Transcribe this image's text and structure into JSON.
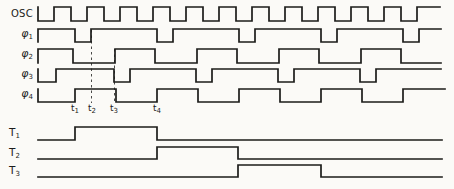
{
  "figure": {
    "type": "timing-diagram",
    "width": 454,
    "height": 189,
    "bg_color": "#fbfaf7",
    "line_color": "#1c1c1a",
    "guide_color": "#4a4a48"
  },
  "waveforms": [
    {
      "id": "osc",
      "label": {
        "base": "OSC",
        "sub": ""
      },
      "row_top": 7,
      "row_bottom": 21,
      "x_start": 38,
      "x_end": 440,
      "start_level": 0,
      "initial_edge": true,
      "transitions": [
        54,
        71,
        87,
        104,
        120,
        137,
        153,
        170,
        186,
        203,
        219,
        236,
        252,
        269,
        285,
        302,
        318,
        335,
        351,
        368,
        384,
        401,
        417
      ]
    },
    {
      "id": "phi1",
      "label": {
        "base": "φ",
        "sub": "1"
      },
      "row_top": 29,
      "row_bottom": 42,
      "x_start": 38,
      "x_end": 441,
      "start_level": 1,
      "initial_edge": true,
      "transitions": [
        75,
        91,
        157,
        173,
        239,
        255,
        321,
        337,
        403,
        419
      ]
    },
    {
      "id": "phi2",
      "label": {
        "base": "φ",
        "sub": "2"
      },
      "row_top": 49,
      "row_bottom": 63,
      "x_start": 38,
      "x_end": 441,
      "start_level": 1,
      "initial_edge": true,
      "transitions": [
        73,
        115,
        155,
        197,
        237,
        279,
        319,
        361,
        401
      ]
    },
    {
      "id": "phi3",
      "label": {
        "base": "φ",
        "sub": "3"
      },
      "row_top": 69,
      "row_bottom": 82,
      "x_start": 38,
      "x_end": 441,
      "start_level": 0,
      "initial_edge": true,
      "transitions": [
        56,
        114,
        130,
        196,
        212,
        278,
        294,
        360,
        376
      ]
    },
    {
      "id": "phi4",
      "label": {
        "base": "φ",
        "sub": "4"
      },
      "row_top": 89,
      "row_bottom": 102,
      "x_start": 38,
      "x_end": 445,
      "start_level": 0,
      "initial_edge": true,
      "transitions": [
        75,
        116,
        157,
        198,
        239,
        280,
        321,
        362,
        403
      ]
    },
    {
      "id": "T1",
      "label": {
        "base": "T",
        "sub": "1"
      },
      "row_top": 127,
      "row_bottom": 140,
      "x_start": 38,
      "x_end": 442,
      "start_level": 0,
      "initial_edge": false,
      "transitions": [
        75,
        157
      ]
    },
    {
      "id": "T2",
      "label": {
        "base": "T",
        "sub": "2"
      },
      "row_top": 147,
      "row_bottom": 159,
      "x_start": 38,
      "x_end": 442,
      "start_level": 0,
      "initial_edge": false,
      "transitions": [
        157,
        238
      ]
    },
    {
      "id": "T3",
      "label": {
        "base": "T",
        "sub": "3"
      },
      "row_top": 165,
      "row_bottom": 177,
      "x_start": 38,
      "x_end": 442,
      "start_level": 0,
      "initial_edge": false,
      "transitions": [
        238,
        321
      ]
    }
  ],
  "t_markers": [
    {
      "base": "t",
      "sub": "1",
      "x": 75
    },
    {
      "base": "t",
      "sub": "2",
      "x": 92
    },
    {
      "base": "t",
      "sub": "3",
      "x": 114
    },
    {
      "base": "t",
      "sub": "4",
      "x": 157
    }
  ],
  "guides": [
    {
      "x": 91.5,
      "y1": 30,
      "y2": 103,
      "style": "dashed"
    },
    {
      "x": 114.5,
      "y1": 49,
      "y2": 103,
      "style": "dashed"
    }
  ]
}
